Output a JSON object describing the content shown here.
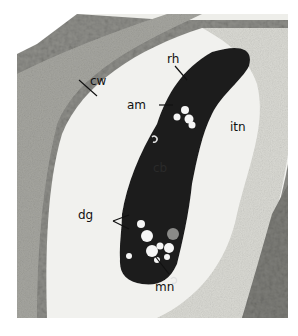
{
  "figure": {
    "type": "transmission electron micrograph",
    "labels": [
      {
        "id": "cw",
        "text": "cw"
      },
      {
        "id": "rh",
        "text": "rh"
      },
      {
        "id": "am",
        "text": "am"
      },
      {
        "id": "itn",
        "text": "itn"
      },
      {
        "id": "cb",
        "text": "cb"
      },
      {
        "id": "dg",
        "text": "dg"
      },
      {
        "id": "mn",
        "text": "mn"
      }
    ]
  },
  "colors": {
    "background": "#ffffff",
    "cell_wall": "#9a9a94",
    "vacuole": "#f1f1ee",
    "interstitial": "#dcdcd6",
    "cell_body": "#1c1c1c",
    "granule": "#f4f4f4"
  }
}
